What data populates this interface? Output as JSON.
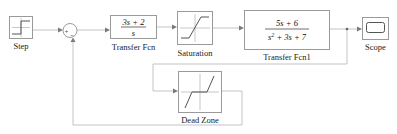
{
  "diagram": {
    "type": "simulink-block-diagram",
    "colors": {
      "block_border": "#9a9a9a",
      "wire": "#b4b4b4",
      "arrow": "#7a7a7a",
      "text": "#222222"
    },
    "blocks": {
      "step": {
        "label": "Step"
      },
      "sum": {
        "sign_plus": "+",
        "sign_minus": "−"
      },
      "tf1": {
        "label": "Transfer Fcn",
        "numerator": "3s + 2",
        "denominator": "s"
      },
      "saturation": {
        "label": "Saturation"
      },
      "tf2": {
        "label": "Transfer Fcn1",
        "numerator": "5s + 6",
        "den_a": "s",
        "den_exp": "2",
        "den_b": " + 3s + 7"
      },
      "scope": {
        "label": "Scope"
      },
      "deadzone": {
        "label": "Dead Zone"
      }
    },
    "connections": [
      "Step → Sum(+)",
      "Sum → Transfer Fcn",
      "Transfer Fcn → Saturation",
      "Saturation → Transfer Fcn1",
      "Transfer Fcn1 → Scope",
      "Transfer Fcn1 → Dead Zone",
      "Dead Zone → Sum(−)"
    ]
  }
}
